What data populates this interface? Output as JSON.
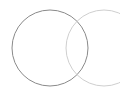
{
  "diagram": {
    "type": "overlapping-circles",
    "circles": [
      {
        "id": "left",
        "cx": 50,
        "cy": 48,
        "r": 38,
        "stroke": "#8a8a8a",
        "stroke_width": 1
      },
      {
        "id": "right",
        "cx": 104,
        "cy": 48,
        "r": 38,
        "stroke": "#cfcfcf",
        "stroke_width": 1
      }
    ]
  }
}
